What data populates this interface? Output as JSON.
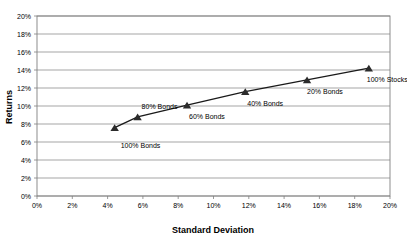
{
  "chart_data": {
    "type": "scatter",
    "title": "",
    "xlabel": "Standard Deviation",
    "ylabel": "Returns",
    "xlim": [
      0,
      20
    ],
    "ylim": [
      0,
      20
    ],
    "grid": true,
    "legend": "none",
    "x_tick_labels": [
      "0%",
      "2%",
      "4%",
      "6%",
      "8%",
      "10%",
      "12%",
      "14%",
      "16%",
      "18%",
      "20%"
    ],
    "y_tick_labels": [
      "0%",
      "2%",
      "4%",
      "6%",
      "8%",
      "10%",
      "12%",
      "14%",
      "16%",
      "18%",
      "20%"
    ],
    "x_ticks": [
      0,
      2,
      4,
      6,
      8,
      10,
      12,
      14,
      16,
      18,
      20
    ],
    "y_ticks": [
      0,
      2,
      4,
      6,
      8,
      10,
      12,
      14,
      16,
      18,
      20
    ],
    "marker_shape": "triangle",
    "marker_color": "#2b2b2b",
    "line_color": "#1a1a1a",
    "points": [
      {
        "label": "100% Bonds",
        "x": 4.4,
        "y": 7.6,
        "label_dx": 6,
        "label_dy": 20
      },
      {
        "label": "80% Bonds",
        "x": 5.7,
        "y": 8.8,
        "label_dx": 4,
        "label_dy": -8
      },
      {
        "label": "60% Bonds",
        "x": 8.5,
        "y": 10.1,
        "label_dx": 2,
        "label_dy": 14
      },
      {
        "label": "40% Bonds",
        "x": 11.8,
        "y": 11.6,
        "label_dx": 2,
        "label_dy": 14
      },
      {
        "label": "20% Bonds",
        "x": 15.3,
        "y": 12.9,
        "label_dx": 0,
        "label_dy": 14
      },
      {
        "label": "100% Stocks",
        "x": 18.8,
        "y": 14.2,
        "label_dx": -2,
        "label_dy": 14
      }
    ]
  },
  "axes": {
    "x_title": "Standard Deviation",
    "y_title": "Returns"
  }
}
